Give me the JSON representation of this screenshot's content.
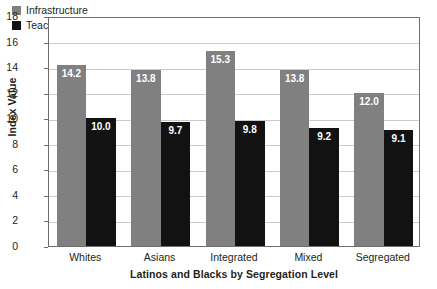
{
  "chart_data": {
    "type": "bar",
    "title": "",
    "xlabel": "Latinos and Blacks by Segregation Level",
    "ylabel": "Index Value",
    "categories": [
      "Whites",
      "Asians",
      "Integrated",
      "Mixed",
      "Segregated"
    ],
    "series": [
      {
        "name": "Infrastructure",
        "color": "#808080",
        "values": [
          14.2,
          13.8,
          15.3,
          13.8,
          12.0
        ],
        "labels": [
          "14.2",
          "13.8",
          "15.3",
          "13.8",
          "12.0"
        ]
      },
      {
        "name": "Teaching",
        "color": "#121212",
        "values": [
          10.0,
          9.7,
          9.8,
          9.2,
          9.1
        ],
        "labels": [
          "10.0",
          "9.7",
          "9.8",
          "9.2",
          "9.1"
        ]
      }
    ],
    "ylim": [
      0,
      18
    ],
    "yticks": [
      0,
      2,
      4,
      6,
      8,
      10,
      12,
      14,
      16,
      18
    ],
    "ytick_labels": [
      "0",
      "2",
      "4",
      "6",
      "8",
      "10",
      "12",
      "14",
      "16",
      "18"
    ],
    "grid": true,
    "grid_axis": "y",
    "legend_position": "top-left-inside",
    "background_color": "#ffffff",
    "gridline_color": "#c9c9c9",
    "frame_color": "#6e6e6e",
    "data_label_color": "#ffffff"
  },
  "legend": {
    "items": [
      {
        "label": "Infrastructure",
        "color": "#808080"
      },
      {
        "label": "Teaching",
        "color": "#121212"
      }
    ]
  }
}
